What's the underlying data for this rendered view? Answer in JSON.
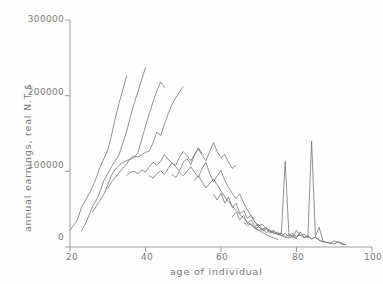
{
  "figure": {
    "name": "annual-earnings-by-age-line-chart",
    "background": "#fefefe",
    "ink_color": "#6e6e6e",
    "axis_color": "#9a9a9a"
  },
  "axes": {
    "x_title": "age of individual",
    "y_title": "annual earnings, real N.T.$",
    "x_ticks": [
      "20",
      "40",
      "60",
      "80",
      "100"
    ],
    "y_ticks": [
      "0",
      "100000",
      "200000",
      "300000"
    ]
  },
  "chart_data": {
    "type": "line",
    "title": "",
    "subtitle": "",
    "xlabel": "age of individual",
    "ylabel": "annual earnings, real N.T.$",
    "xlim": [
      20,
      100
    ],
    "ylim": [
      0,
      300000
    ],
    "xticks": [
      20,
      40,
      60,
      80,
      100
    ],
    "yticks": [
      0,
      100000,
      200000,
      300000
    ],
    "grid": false,
    "legend": null,
    "legend_position": "none",
    "annotations": [
      {
        "text": "sharp spike",
        "x": 77,
        "y": 113000
      },
      {
        "text": "sharp spike",
        "x": 84,
        "y": 140000
      }
    ],
    "note": "Overlapping synthetic-cohort age-earnings profiles; each series is one birth cohort followed across survey years.",
    "series": [
      {
        "name": "cohort-1",
        "x": [
          20,
          21,
          22,
          23,
          24,
          25,
          26,
          27,
          28,
          29,
          30,
          31,
          32,
          33,
          34,
          35
        ],
        "values": [
          22000,
          29000,
          36000,
          52000,
          61000,
          70000,
          80000,
          92000,
          106000,
          117000,
          128000,
          148000,
          170000,
          190000,
          208000,
          226000
        ]
      },
      {
        "name": "cohort-2",
        "x": [
          23,
          24,
          25,
          26,
          27,
          28,
          29,
          30,
          31,
          32,
          33,
          34,
          35,
          36,
          37,
          38,
          39,
          40
        ],
        "values": [
          21000,
          30000,
          41000,
          54000,
          62000,
          74000,
          88000,
          97000,
          106000,
          114000,
          122000,
          137000,
          153000,
          172000,
          190000,
          205000,
          222000,
          237000
        ]
      },
      {
        "name": "cohort-3",
        "x": [
          26,
          27,
          28,
          29,
          30,
          31,
          32,
          33,
          34,
          35,
          36,
          37,
          38,
          39,
          40,
          41,
          42,
          43,
          44,
          45
        ],
        "values": [
          46000,
          54000,
          62000,
          70000,
          82000,
          95000,
          103000,
          108000,
          112000,
          114000,
          116000,
          118000,
          125000,
          142000,
          160000,
          176000,
          192000,
          206000,
          218000,
          211000
        ]
      },
      {
        "name": "cohort-4",
        "x": [
          30,
          31,
          32,
          33,
          34,
          35,
          36,
          37,
          38,
          39,
          40,
          41,
          42,
          43,
          44,
          45,
          46,
          47,
          48,
          49,
          50
        ],
        "values": [
          77000,
          86000,
          92000,
          98000,
          104000,
          110000,
          117000,
          120000,
          119000,
          122000,
          125000,
          127000,
          138000,
          152000,
          147000,
          162000,
          176000,
          188000,
          197000,
          205000,
          212000
        ]
      },
      {
        "name": "cohort-5",
        "x": [
          35,
          36,
          37,
          38,
          39,
          40,
          41,
          42,
          43,
          44,
          45,
          46,
          47,
          48,
          49,
          50,
          51,
          52,
          53,
          54,
          55
        ],
        "values": [
          94000,
          99000,
          100000,
          97000,
          102000,
          99000,
          106000,
          112000,
          108000,
          113000,
          122000,
          116000,
          111000,
          108000,
          119000,
          126000,
          121000,
          114000,
          122000,
          131000,
          124000
        ]
      },
      {
        "name": "cohort-6",
        "x": [
          41,
          42,
          43,
          44,
          45,
          46,
          47,
          48,
          49,
          50,
          51,
          52,
          53,
          54,
          55,
          56,
          57,
          58,
          59,
          60,
          61,
          62,
          63,
          64
        ],
        "values": [
          94000,
          91000,
          97000,
          101000,
          96000,
          104000,
          111000,
          106000,
          100000,
          112000,
          117000,
          109000,
          122000,
          130000,
          121000,
          114000,
          126000,
          138000,
          126000,
          118000,
          122000,
          112000,
          104000,
          108000
        ]
      },
      {
        "name": "cohort-7",
        "x": [
          47,
          48,
          49,
          50,
          51,
          52,
          53,
          54,
          55,
          56,
          57,
          58,
          59,
          60,
          61,
          62,
          63,
          64,
          65,
          66,
          67,
          68,
          69,
          70
        ],
        "values": [
          96000,
          92000,
          99000,
          94000,
          100000,
          106000,
          99000,
          92000,
          104000,
          112000,
          97000,
          86000,
          94000,
          101000,
          88000,
          79000,
          71000,
          64000,
          70000,
          58000,
          49000,
          41000,
          33000,
          26000
        ]
      },
      {
        "name": "cohort-8",
        "x": [
          53,
          54,
          55,
          56,
          57,
          58,
          59,
          60,
          61,
          62,
          63,
          64,
          65,
          66,
          67,
          68,
          69,
          70,
          71,
          72,
          73,
          74,
          75
        ],
        "values": [
          88000,
          94000,
          86000,
          78000,
          84000,
          90000,
          82000,
          74000,
          66000,
          60000,
          54000,
          48000,
          43000,
          38000,
          33000,
          29000,
          25000,
          22000,
          19000,
          16000,
          14000,
          12000,
          10000
        ]
      },
      {
        "name": "cohort-9",
        "x": [
          58,
          59,
          60,
          61,
          62,
          63,
          64,
          65,
          66,
          67,
          68,
          69,
          70,
          71,
          72,
          73,
          74,
          75,
          76,
          77,
          78,
          79,
          80
        ],
        "values": [
          70000,
          62000,
          71000,
          58000,
          66000,
          52000,
          58000,
          44000,
          48000,
          38000,
          42000,
          33000,
          28000,
          30000,
          24000,
          22000,
          19000,
          17000,
          15000,
          13000,
          12000,
          14000,
          11000
        ]
      },
      {
        "name": "cohort-10",
        "x": [
          63,
          64,
          65,
          66,
          67,
          68,
          69,
          70,
          71,
          72,
          73,
          74,
          75,
          76,
          77,
          78,
          79,
          80,
          81,
          82,
          83,
          84,
          85,
          86,
          87
        ],
        "values": [
          40000,
          46000,
          36000,
          42000,
          31000,
          36000,
          27000,
          30000,
          23000,
          26000,
          20000,
          22000,
          17000,
          19000,
          113000,
          16000,
          18000,
          14000,
          16000,
          12000,
          14000,
          11000,
          13000,
          9000,
          6000
        ]
      },
      {
        "name": "cohort-11",
        "x": [
          66,
          67,
          68,
          69,
          70,
          71,
          72,
          73,
          74,
          75,
          76,
          77,
          78,
          79,
          80,
          81,
          82,
          83,
          84,
          85,
          86,
          87,
          88,
          89,
          90,
          91,
          92,
          93
        ],
        "values": [
          33000,
          28000,
          31000,
          24000,
          27000,
          21000,
          24000,
          18000,
          21000,
          16000,
          18000,
          14000,
          16000,
          13000,
          22000,
          15000,
          17000,
          12000,
          140000,
          14000,
          26000,
          8000,
          6000,
          5000,
          4000,
          7000,
          5000,
          3000
        ]
      },
      {
        "name": "cohort-12",
        "x": [
          69,
          70,
          71,
          72,
          73,
          74,
          75,
          76,
          77,
          78,
          79,
          80,
          81,
          82,
          83,
          84,
          85,
          86,
          87,
          88,
          89,
          90,
          91,
          92,
          93
        ],
        "values": [
          26000,
          22000,
          25000,
          19000,
          22000,
          17000,
          20000,
          15000,
          18000,
          14000,
          16000,
          12000,
          20000,
          13000,
          15000,
          11000,
          13000,
          9000,
          7000,
          6000,
          5000,
          8000,
          6000,
          4000,
          3000
        ]
      }
    ]
  }
}
